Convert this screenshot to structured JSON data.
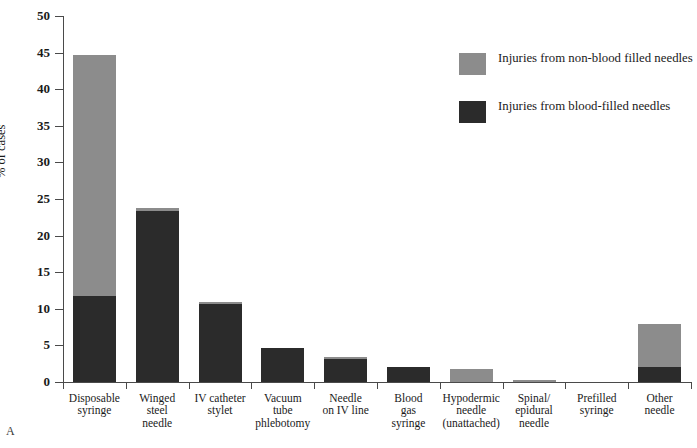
{
  "chart_data": {
    "type": "bar",
    "subtype": "stacked-vertical",
    "title": "",
    "xlabel": "",
    "ylabel": "% of cases",
    "ylim": [
      0,
      50
    ],
    "yticks": [
      0,
      5,
      10,
      15,
      20,
      25,
      30,
      35,
      40,
      45,
      50
    ],
    "grid": false,
    "legend_position": "upper-right-inside",
    "panel_label": "A",
    "categories": [
      "Disposable\nsyringe",
      "Winged\nsteel\nneedle",
      "IV  catheter\nstylet",
      "Vacuum\ntube\nphlebotomy",
      "Needle\non IV line",
      "Blood\ngas\nsyringe",
      "Hypodermic\nneedle\n(unattached)",
      "Spinal/\nepidural\nneedle",
      "Prefilled\nsyringe",
      "Other\nneedle"
    ],
    "series": [
      {
        "name": "Injuries from blood-filled needles",
        "color": "#2b2b2b",
        "values": [
          11.8,
          23.4,
          10.6,
          4.7,
          3.1,
          2.1,
          0.0,
          0.0,
          0.0,
          2.1
        ]
      },
      {
        "name": "Injuries from non-blood filled needles",
        "color": "#8c8c8c",
        "values": [
          32.9,
          0.4,
          0.4,
          0.0,
          0.3,
          0.0,
          1.8,
          0.3,
          0.0,
          5.8
        ]
      }
    ],
    "totals": [
      44.7,
      23.8,
      11.0,
      4.7,
      3.4,
      2.1,
      1.8,
      0.3,
      0.0,
      7.9
    ]
  },
  "legend": {
    "items": [
      {
        "label": "Injuries from non-blood filled needles",
        "color": "#8c8c8c"
      },
      {
        "label": "Injuries from blood-filled needles",
        "color": "#2b2b2b"
      }
    ]
  },
  "axes": {
    "y_title": "% of cases",
    "y_tick_labels": [
      "0",
      "5",
      "10",
      "15",
      "20",
      "25",
      "30",
      "35",
      "40",
      "45",
      "50"
    ]
  },
  "panel": {
    "label": "A"
  }
}
